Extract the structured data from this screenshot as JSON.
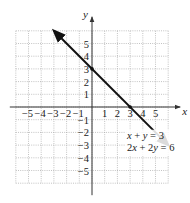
{
  "chart_data": {
    "type": "line",
    "title": "",
    "xlabel": "x",
    "ylabel": "y",
    "xlim": [
      -6,
      6
    ],
    "ylim": [
      -6,
      6
    ],
    "grid": true,
    "x_ticks": [
      -5,
      -4,
      -3,
      -2,
      -1,
      1,
      2,
      3,
      4,
      5
    ],
    "y_ticks": [
      5,
      4,
      3,
      2,
      1,
      -1,
      -2,
      -3,
      -4,
      -5
    ],
    "x_tick_labels": [
      "−5",
      "−4",
      "−3",
      "−2",
      "−1",
      "1",
      "2",
      "3",
      "4",
      "5"
    ],
    "y_tick_labels": [
      "5",
      "4",
      "3",
      "2",
      "1",
      "−1",
      "−2",
      "−3",
      "−4",
      "−5"
    ],
    "series": [
      {
        "name": "x + y = 3",
        "equation_alt": "2x + 2y = 6",
        "points": [
          [
            -3,
            6
          ],
          [
            0,
            3
          ],
          [
            3,
            0
          ],
          [
            6,
            -3
          ]
        ],
        "arrows_both_ends": true
      }
    ],
    "annotations": [
      {
        "text_line1": "x + y = 3",
        "text_line2": "2x + 2y = 6",
        "position": [
          4.8,
          -2.5
        ]
      }
    ],
    "intercepts_marked": [
      [
        0,
        3
      ],
      [
        3,
        0
      ]
    ]
  },
  "labels": {
    "x_axis": "x",
    "y_axis": "y",
    "eq1": "x + y = 3",
    "eq2": "2x + 2y = 6"
  }
}
